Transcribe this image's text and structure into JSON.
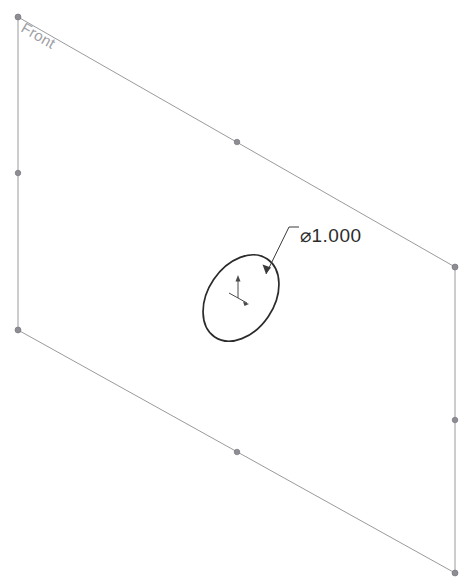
{
  "viewport": {
    "width": 463,
    "height": 587,
    "background_color": "#ffffff"
  },
  "plane": {
    "label": "Front",
    "label_rotation_deg": 29.8,
    "label_x": 20,
    "label_y": 31,
    "edge_color": "#9a9a9f",
    "vertex_color": "#8d8d93",
    "corners": [
      {
        "name": "top-left",
        "x": 18,
        "y": 17
      },
      {
        "name": "top-right",
        "x": 455,
        "y": 267
      },
      {
        "name": "bottom-right",
        "x": 455,
        "y": 573
      },
      {
        "name": "bottom-left",
        "x": 18,
        "y": 330
      }
    ],
    "midpoints": [
      {
        "name": "top-edge-midpoint",
        "x": 237,
        "y": 142
      },
      {
        "name": "right-edge-midpoint",
        "x": 455,
        "y": 420
      },
      {
        "name": "bottom-edge-midpoint",
        "x": 237,
        "y": 452
      },
      {
        "name": "left-edge-midpoint",
        "x": 18,
        "y": 173
      }
    ]
  },
  "sketch": {
    "circle": {
      "center_x": 241,
      "center_y": 298,
      "radius_x": 47,
      "radius_y": 33,
      "rotation_deg": -56,
      "stroke_color": "#2b2b2b"
    },
    "origin": {
      "x": 238,
      "y": 292
    }
  },
  "dimension": {
    "symbol": "⌀",
    "value": "1.000",
    "text": "⌀1.000",
    "text_x": 300,
    "text_y": 242,
    "leader": {
      "arrow_x": 266,
      "arrow_y": 274,
      "kink_x": 289,
      "kink_y": 227,
      "tail_x": 299,
      "tail_y": 227
    }
  }
}
